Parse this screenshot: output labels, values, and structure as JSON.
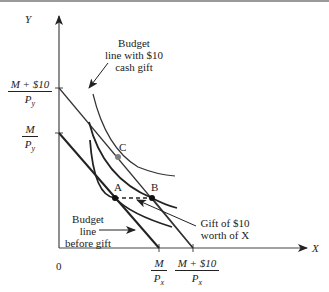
{
  "diagram": {
    "axes": {
      "y_label": "Y",
      "x_label": "X",
      "origin_label": "0"
    },
    "y_intercepts": [
      {
        "numerator": "M + $10",
        "denominator": "P",
        "sub": "y"
      },
      {
        "numerator": "M",
        "denominator": "P",
        "sub": "y"
      }
    ],
    "x_intercepts": [
      {
        "numerator": "M",
        "denominator": "P",
        "sub": "x"
      },
      {
        "numerator": "M + $10",
        "denominator": "P",
        "sub": "x"
      }
    ],
    "points": {
      "a": "A",
      "b": "B",
      "c": "C"
    },
    "annotations": {
      "cash_gift_line": [
        "Budget",
        "line with $10",
        "cash gift"
      ],
      "before_gift_line": [
        "Budget",
        "line",
        "before gift"
      ],
      "gift_in_kind": [
        "Gift of $10",
        "worth of X"
      ]
    },
    "colors": {
      "line": "#222222",
      "point_c": "#808080",
      "frame": "#9a9a9a"
    }
  }
}
